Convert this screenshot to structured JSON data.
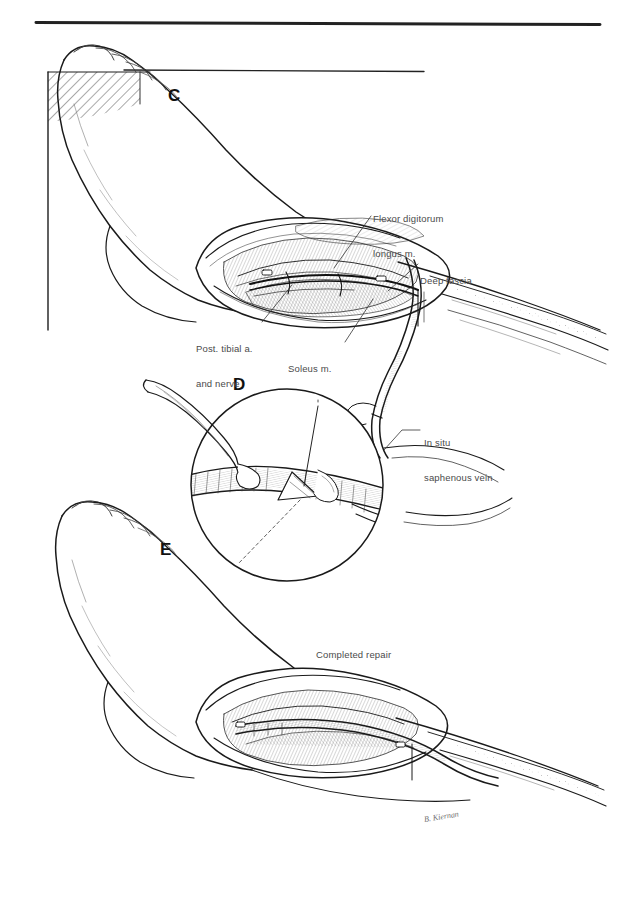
{
  "figure": {
    "kind": "surgical-anatomy-plate",
    "medium": "pen-and-ink line drawing",
    "background_color": "#ffffff",
    "ink_color": "#1a1a1a",
    "label_color": "#4a4a4a",
    "top_rule": {
      "present": true,
      "x1": 36,
      "x2": 600,
      "y": 22,
      "thickness": 3
    }
  },
  "panels": [
    {
      "id": "C",
      "letter": "C",
      "letter_pos": {
        "x": 168,
        "y": 97
      },
      "description": "Medial view of foot and lower leg with open fasciotomy-style incision exposing deep structures; horizontal pointer rule above; hatched table/drape edge at upper left."
    },
    {
      "id": "D",
      "letter": "D",
      "letter_pos": {
        "x": 233,
        "y": 386
      },
      "description": "Circular magnified inset showing the in situ saphenous vein, a side branch being ligated and a valvulotome / valve cusp detail, with forceps entering from the left."
    },
    {
      "id": "E",
      "letter": "E",
      "letter_pos": {
        "x": 160,
        "y": 551
      },
      "description": "Medial view of foot and lower leg after completion, incision closed over the bypass graft."
    }
  ],
  "labels": [
    {
      "id": "flexor-digitorum-longus",
      "text": "Flexor digitorum\nlongus m.",
      "line1": "Flexor digitorum",
      "line2": "longus m.",
      "x": 373,
      "y": 190,
      "leader": {
        "x1": 371,
        "y1": 215,
        "x2": 332,
        "y2": 268
      }
    },
    {
      "id": "deep-fascia",
      "text": "Deep fascia",
      "line1": "Deep fascia",
      "x": 420,
      "y": 256,
      "leader": {
        "x1": 418,
        "y1": 263,
        "x2": 388,
        "y2": 290
      }
    },
    {
      "id": "post-tibial-a-and-nerve",
      "text": "Post. tibial a.\nand nerve",
      "line1": "Post. tibial a.",
      "line2": "and nerve",
      "x": 196,
      "y": 325,
      "leader": {
        "x1": 262,
        "y1": 326,
        "x2": 290,
        "y2": 286
      }
    },
    {
      "id": "soleus-m",
      "text": "Soleus m.",
      "line1": "Soleus m.",
      "x": 288,
      "y": 345,
      "leader": {
        "x1": 345,
        "y1": 345,
        "x2": 372,
        "y2": 300
      }
    },
    {
      "id": "in-situ-saphenous-vein",
      "text": "In situ\nsaphenous vein",
      "line1": "In situ",
      "line2": "saphenous vein",
      "x": 424,
      "y": 419,
      "leader": {
        "x1": 420,
        "y1": 432,
        "x2": 381,
        "y2": 455
      }
    },
    {
      "id": "completed-repair",
      "text": "Completed repair",
      "line1": "Completed repair",
      "x": 316,
      "y": 630
    }
  ],
  "signature": {
    "id": "artist-signature",
    "text": "B. Kiernan",
    "x": 424,
    "y": 817,
    "legible": false
  },
  "anatomy_elements": [
    {
      "name": "foot-and-ankle-panel-c",
      "panel": "C"
    },
    {
      "name": "surgical-incision-panel-c",
      "panel": "C"
    },
    {
      "name": "table-edge-hatching",
      "panel": "C"
    },
    {
      "name": "pointer-rule",
      "panel": "C"
    },
    {
      "name": "saphenous-vein-loop",
      "panel": "C"
    },
    {
      "name": "circular-inset-frame",
      "panel": "D"
    },
    {
      "name": "forceps",
      "panel": "D"
    },
    {
      "name": "vein-with-valve-cusp",
      "panel": "D"
    },
    {
      "name": "foot-and-ankle-panel-e",
      "panel": "E"
    },
    {
      "name": "closed-repair-incision",
      "panel": "E"
    }
  ]
}
